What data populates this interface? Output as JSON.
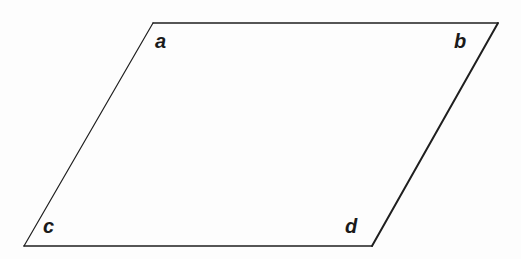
{
  "figure": {
    "name": "parallelogram",
    "background_color": "#fdfdfd",
    "stroke_color": "#1f1f1f",
    "fill_color": "none",
    "labels": {
      "a": "a",
      "b": "b",
      "c": "c",
      "d": "d"
    },
    "vertices": [
      {
        "id": "a",
        "label": "a",
        "x": 153,
        "y": 23,
        "position": "top-left"
      },
      {
        "id": "b",
        "label": "b",
        "x": 498,
        "y": 23,
        "position": "top-right"
      },
      {
        "id": "d",
        "label": "d",
        "x": 372,
        "y": 246,
        "position": "bottom-right"
      },
      {
        "id": "c",
        "label": "c",
        "x": 24,
        "y": 246,
        "position": "bottom-left"
      }
    ],
    "edges": [
      {
        "id": "top",
        "from": "a",
        "to": "b",
        "stroke_width": 1.3
      },
      {
        "id": "right",
        "from": "b",
        "to": "d",
        "stroke_width": 2.0
      },
      {
        "id": "bottom",
        "from": "d",
        "to": "c",
        "stroke_width": 1.6
      },
      {
        "id": "left",
        "from": "c",
        "to": "a",
        "stroke_width": 1.2
      }
    ]
  }
}
